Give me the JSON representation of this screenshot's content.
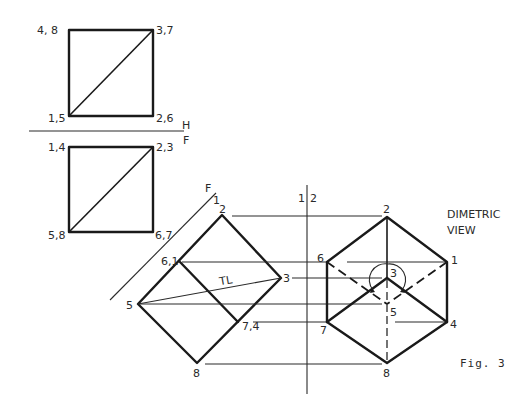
{
  "figure": {
    "caption": "Fig. 3",
    "view_title_line1": "DIMETRIC",
    "view_title_line2": "VIEW",
    "tl_label": "TL"
  },
  "fold_lines": {
    "hf_top": "H",
    "hf_bottom": "F",
    "f1_f": "F",
    "f1_1": "1",
    "v12_left": "1",
    "v12_right": "2"
  },
  "top_view": {
    "labels": {
      "top_left": "4, 8",
      "top_right": "3,7",
      "bottom_left": "1,5",
      "bottom_right": "2,6"
    }
  },
  "front_view": {
    "labels": {
      "top_left": "1,4",
      "top_right": "2,3",
      "bottom_left": "5,8",
      "bottom_right": "6,7"
    }
  },
  "auxiliary_view": {
    "labels": {
      "p2": "2",
      "p61": "6,1",
      "p3": "3",
      "p5": "5",
      "p74": "7,4",
      "p8": "8"
    }
  },
  "dimetric_view": {
    "labels": {
      "p2": "2",
      "p6": "6",
      "p1": "1",
      "p3": "3",
      "p5": "5",
      "p7": "7",
      "p4": "4",
      "p8": "8"
    }
  }
}
